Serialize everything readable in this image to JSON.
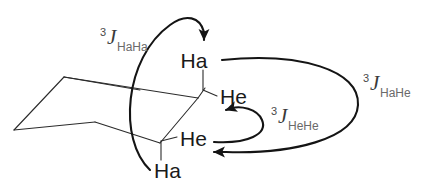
{
  "figure": {
    "background_color": "#ffffff",
    "line_color": "#2b2b2b",
    "arrow_color": "#141414",
    "label_color": "#1a1a1a"
  },
  "atoms": {
    "axial_top": "Ha",
    "equatorial_top": "He",
    "equatorial_bottom": "He",
    "axial_bottom": "Ha"
  },
  "couplings": [
    {
      "id": "haha",
      "superscript": "3",
      "symbol": "J",
      "subscript": "HaHa",
      "description": "axial-axial vicinal coupling"
    },
    {
      "id": "hahe",
      "superscript": "3",
      "symbol": "J",
      "subscript": "HaHe",
      "description": "axial-equatorial vicinal coupling"
    },
    {
      "id": "hehe",
      "superscript": "3",
      "symbol": "J",
      "subscript": "HeHe",
      "description": "equatorial-equatorial vicinal coupling"
    }
  ]
}
